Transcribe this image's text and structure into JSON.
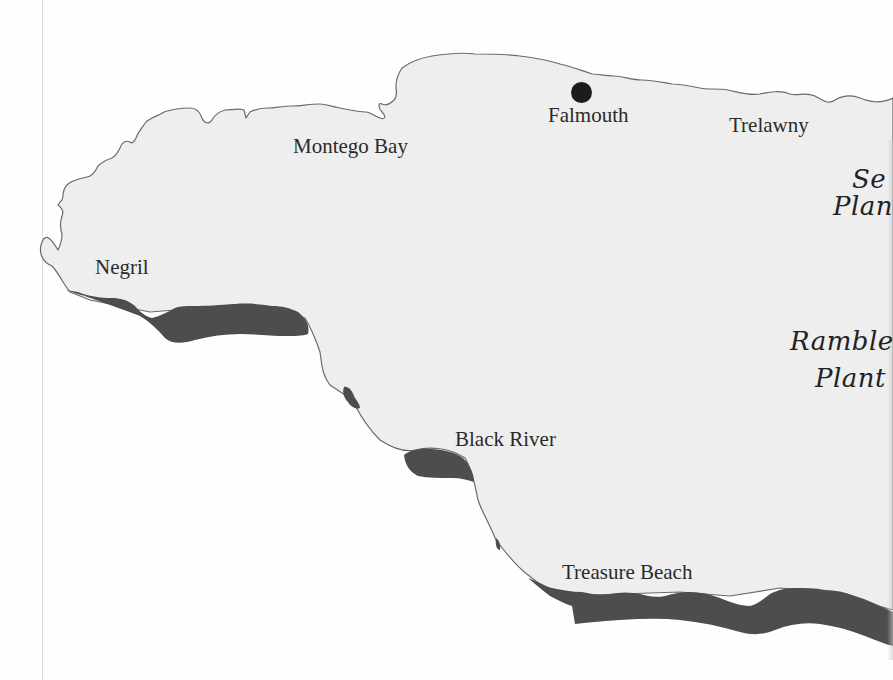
{
  "map": {
    "region": "Western Jamaica",
    "colors": {
      "land_fill": "#eeeeee",
      "coastline": "#6a6a6a",
      "shaded_coast": "#4d4d4d",
      "background": "#fefefe",
      "label_text": "#2a2a2a"
    },
    "places": [
      {
        "name": "Negril",
        "x": 95,
        "y": 258
      },
      {
        "name": "Montego Bay",
        "x": 293,
        "y": 137
      },
      {
        "name": "Falmouth",
        "x": 548,
        "y": 106,
        "marker": "dot"
      },
      {
        "name": "Trelawny",
        "x": 729,
        "y": 116
      },
      {
        "name": "Black River",
        "x": 455,
        "y": 430
      },
      {
        "name": "Treasure Beach",
        "x": 562,
        "y": 563
      }
    ],
    "script_labels": [
      {
        "line1": "Se",
        "line2": "Plan",
        "x": 833,
        "y": 168,
        "note": "cut off at right edge"
      },
      {
        "line1": "Ramble",
        "line2": "Plant",
        "x": 790,
        "y": 330,
        "note": "cut off at right edge"
      }
    ]
  }
}
